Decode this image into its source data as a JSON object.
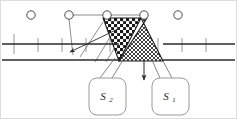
{
  "figure": {
    "background_color": "#ffffff",
    "stroke_color": "#3a3a3a",
    "frame_color": "#d8d8d8",
    "width": 237,
    "height": 119
  },
  "band": {
    "name": "horizontal-road-band",
    "top_line_y": 44,
    "bottom_line_y": 60,
    "x_start": 2,
    "x_end": 235,
    "tick_marks_x": [
      14,
      38,
      62,
      86,
      110,
      134,
      158,
      182,
      206
    ],
    "tick_color": "#8c8c8c"
  },
  "nodes": [
    {
      "name": "node-1",
      "cx": 31,
      "cy": 15,
      "r": 4.2
    },
    {
      "name": "node-2",
      "cx": 69,
      "cy": 15,
      "r": 4.2
    },
    {
      "name": "node-3",
      "cx": 107,
      "cy": 15,
      "r": 4.2
    },
    {
      "name": "node-4",
      "cx": 144,
      "cy": 15,
      "r": 4.2
    },
    {
      "name": "node-5",
      "cx": 178,
      "cy": 15,
      "r": 4.2
    }
  ],
  "regions": [
    {
      "name": "region-s2",
      "label": "S",
      "subscript": "2",
      "pattern": "checkerboard-dot-grid",
      "shape": "downward-triangle",
      "points": "103,18 141,18 119,61"
    },
    {
      "name": "region-s1",
      "label": "S",
      "subscript": "1",
      "pattern": "fine-cross-hatch",
      "shape": "quadrilateral",
      "points": "141,18 119,61 163,61 147,18"
    }
  ],
  "callouts": [
    {
      "name": "callout-s2",
      "label": "S",
      "subscript": "2",
      "x": 89,
      "y": 78,
      "w": 37,
      "h": 37,
      "radius": 8
    },
    {
      "name": "callout-s1",
      "label": "S",
      "subscript": "1",
      "x": 152,
      "y": 78,
      "w": 37,
      "h": 37,
      "radius": 8
    }
  ],
  "arrows": [
    {
      "name": "arrow-to-band-left",
      "from_x": 117,
      "from_y": 22,
      "to_x": 70,
      "to_y": 52,
      "direction": "down-left"
    },
    {
      "name": "arrow-down-to-s1",
      "from_x": 144,
      "from_y": 60,
      "to_x": 144,
      "to_y": 78,
      "direction": "down"
    }
  ],
  "leader_lines": [
    {
      "name": "leader-s2-a",
      "x1": 108,
      "x2": 119,
      "y1": 78,
      "y2": 58
    },
    {
      "name": "leader-s2-b",
      "x1": 118,
      "x2": 126,
      "y1": 78,
      "y2": 60
    },
    {
      "name": "leader-s1-a",
      "x1": 157,
      "x2": 150,
      "y1": 78,
      "y2": 60
    },
    {
      "name": "leader-s1-b",
      "x1": 166,
      "x2": 160,
      "y1": 78,
      "y2": 61
    },
    {
      "name": "spoke-node2-down",
      "x1": 69,
      "x2": 72,
      "y1": 19,
      "y2": 53
    },
    {
      "name": "spoke-node3-down",
      "x1": 106,
      "x2": 70,
      "y1": 20,
      "y2": 52
    },
    {
      "name": "top-connector",
      "x1": 69,
      "x2": 144,
      "y1": 15,
      "y2": 15
    }
  ]
}
